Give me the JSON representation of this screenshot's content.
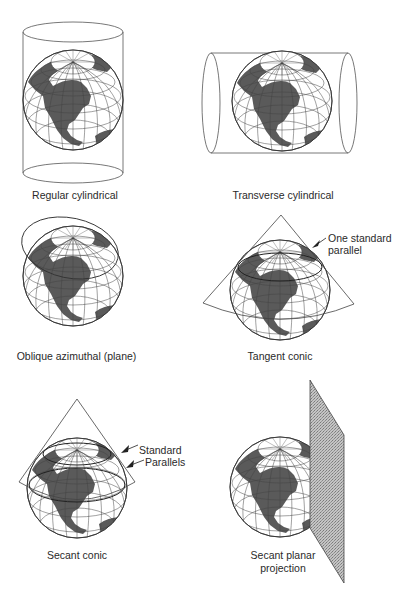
{
  "page": {
    "cropped_header_text": "—————— ———— ——————"
  },
  "figure": {
    "panels": [
      {
        "id": "regular-cylindrical",
        "caption": "Regular cylindrical",
        "surface": "cylinder-vertical"
      },
      {
        "id": "transverse-cylindrical",
        "caption": "Transverse cylindrical",
        "surface": "cylinder-horizontal"
      },
      {
        "id": "oblique-azimuthal",
        "caption": "Oblique azimuthal (plane)",
        "surface": "plane-oblique"
      },
      {
        "id": "tangent-conic",
        "caption": "Tangent conic",
        "surface": "cone-tangent",
        "annotation": [
          "One standard",
          "parallel"
        ]
      },
      {
        "id": "secant-conic",
        "caption": "Secant conic",
        "surface": "cone-secant",
        "annotation": [
          "Standard",
          "Parallels"
        ]
      },
      {
        "id": "secant-planar",
        "caption": [
          "Secant planar",
          "projection"
        ],
        "surface": "plane-secant"
      }
    ],
    "colors": {
      "land": "#5a5a5a",
      "ocean": "#ffffff",
      "grid": "#444444",
      "outline": "#333333",
      "plane_fill": "#b8b8b8"
    }
  }
}
